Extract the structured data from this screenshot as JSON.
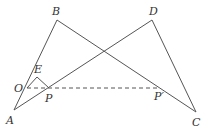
{
  "diagram": {
    "type": "geometry",
    "colors": {
      "stroke": "#555555",
      "label": "#333333",
      "background": "#ffffff"
    },
    "points": {
      "A": {
        "label": "A",
        "x": 14,
        "y": 110,
        "lx": 6,
        "ly": 124
      },
      "B": {
        "label": "B",
        "x": 57,
        "y": 20,
        "lx": 52,
        "ly": 15
      },
      "D": {
        "label": "D",
        "x": 152,
        "y": 20,
        "lx": 149,
        "ly": 15
      },
      "C": {
        "label": "C",
        "x": 196,
        "y": 112,
        "lx": 192,
        "ly": 126
      },
      "O": {
        "label": "O",
        "x": 27,
        "y": 88,
        "lx": 14,
        "ly": 92
      },
      "E": {
        "label": "E",
        "x": 37,
        "y": 77,
        "lx": 34,
        "ly": 73
      },
      "P": {
        "label": "P",
        "x": 49,
        "y": 88,
        "lx": 45,
        "ly": 102
      },
      "P2": {
        "label": "P′",
        "x": 160,
        "y": 88,
        "lx": 154,
        "ly": 100
      }
    },
    "segments": [
      {
        "from": "A",
        "to": "B",
        "style": "solid"
      },
      {
        "from": "B",
        "to": "C",
        "style": "solid"
      },
      {
        "from": "A",
        "to": "D",
        "style": "solid"
      },
      {
        "from": "D",
        "to": "C",
        "style": "solid"
      },
      {
        "from": "O",
        "to": "E",
        "style": "solid"
      },
      {
        "from": "E",
        "to": "P",
        "style": "solid"
      },
      {
        "from": "O",
        "to": "P2",
        "style": "dashed"
      }
    ]
  }
}
